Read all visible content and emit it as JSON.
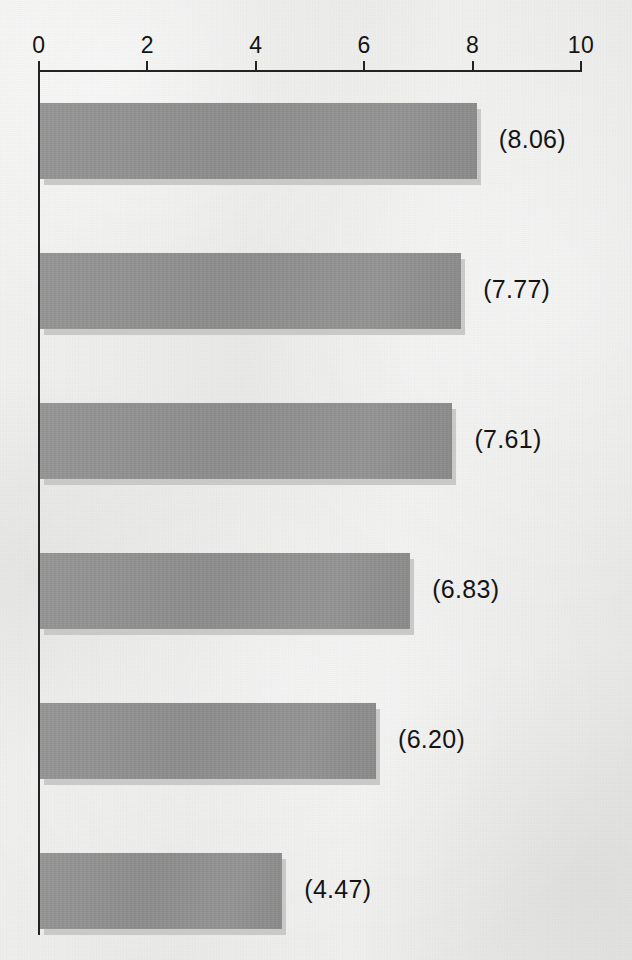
{
  "chart_data": {
    "type": "bar",
    "orientation": "horizontal",
    "title": "",
    "xlabel": "",
    "ylabel": "",
    "xlim": [
      0,
      10
    ],
    "grid": false,
    "legend": null,
    "categories": [
      "",
      "",
      "",
      "",
      "",
      ""
    ],
    "values": [
      8.06,
      7.77,
      7.61,
      6.83,
      6.2,
      4.47
    ],
    "value_labels": [
      "(8.06)",
      "(7.77)",
      "(7.61)",
      "(6.83)",
      "(6.20)",
      "(4.47)"
    ],
    "axis_ticks": [
      {
        "value": 0,
        "label": "0"
      },
      {
        "value": 2,
        "label": "2"
      },
      {
        "value": 4,
        "label": "4"
      },
      {
        "value": 6,
        "label": "6"
      },
      {
        "value": 8,
        "label": "8"
      },
      {
        "value": 10,
        "label": "10"
      }
    ],
    "colors": {
      "background": "#ececeb",
      "bar_fill": "#919191",
      "bar_shadow": "#c9c9c8",
      "axis": "#232323",
      "text": "#141414"
    }
  },
  "geometry": {
    "axis_x0_px": 38,
    "axis_x10_px": 580,
    "px_per_unit": 54.2,
    "axis_line_y_px": 70,
    "tick_label_y_px": 32,
    "bar_top_start_px": 103,
    "bar_pitch_px": 150,
    "bar_height_px": 76,
    "shadow_offset_px": 6,
    "label_gap_px": 18,
    "y_axis_bottom_px": 935
  }
}
